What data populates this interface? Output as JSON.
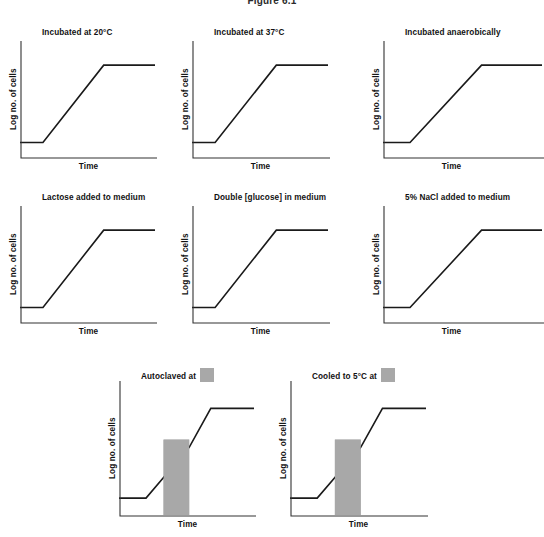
{
  "figure": {
    "caption": "Figure 6.1",
    "axis_color": "#333333",
    "curve_color": "#1a1a1a",
    "band_color": "#a8a8a8",
    "background": "#ffffff"
  },
  "common": {
    "ylabel": "Log no. of cells",
    "xlabel": "Time",
    "swatch_icon": "gray-band-swatch"
  },
  "panels": [
    {
      "id": "incubated-20c",
      "title": "Incubated at 20°C",
      "row": 1,
      "col": 1,
      "show_ylabel": true,
      "band": null
    },
    {
      "id": "incubated-37c",
      "title": "Incubated at 37°C",
      "row": 1,
      "col": 2,
      "show_ylabel": true,
      "band": null
    },
    {
      "id": "incubated-anaerobically",
      "title": "Incubated anaerobically",
      "row": 1,
      "col": 3,
      "show_ylabel": true,
      "band": null
    },
    {
      "id": "lactose-added",
      "title": "Lactose added to medium",
      "row": 2,
      "col": 1,
      "show_ylabel": true,
      "band": null
    },
    {
      "id": "double-glucose",
      "title": "Double [glucose] in medium",
      "row": 2,
      "col": 2,
      "show_ylabel": true,
      "band": null
    },
    {
      "id": "nacl-added",
      "title": "5% NaCl added to medium",
      "row": 2,
      "col": 3,
      "show_ylabel": true,
      "band": null
    },
    {
      "id": "autoclaved-at",
      "title": "Autoclaved at",
      "title_has_swatch": true,
      "row": 3,
      "col": 1,
      "show_ylabel": true,
      "band": {
        "x0": 0.33,
        "x1": 0.52,
        "y_top": 0.58
      }
    },
    {
      "id": "cooled-5c-at",
      "title": "Cooled to 5°C at",
      "title_has_swatch": true,
      "row": 3,
      "col": 2,
      "show_ylabel": true,
      "band": {
        "x0": 0.33,
        "x1": 0.52,
        "y_top": 0.58
      }
    }
  ],
  "chart_data": {
    "type": "line",
    "title": "Figure 6.1",
    "xlabel": "Time",
    "ylabel": "Log no. of cells",
    "xlim": [
      0,
      1
    ],
    "ylim": [
      0,
      1
    ],
    "grid": false,
    "legend": "none",
    "axis_ticks": "none",
    "series": [
      {
        "name": "Incubated at 20°C",
        "panel": "incubated-20c",
        "points": [
          [
            0.0,
            0.13
          ],
          [
            0.17,
            0.13
          ],
          [
            0.62,
            0.82
          ],
          [
            1.0,
            0.82
          ]
        ],
        "phases": [
          "lag",
          "exponential",
          "stationary"
        ]
      },
      {
        "name": "Incubated at 37°C",
        "panel": "incubated-37c",
        "points": [
          [
            0.0,
            0.13
          ],
          [
            0.17,
            0.13
          ],
          [
            0.62,
            0.82
          ],
          [
            1.0,
            0.82
          ]
        ],
        "phases": [
          "lag",
          "exponential",
          "stationary"
        ]
      },
      {
        "name": "Incubated anaerobically",
        "panel": "incubated-anaerobically",
        "points": [
          [
            0.0,
            0.13
          ],
          [
            0.17,
            0.13
          ],
          [
            0.62,
            0.82
          ],
          [
            1.0,
            0.82
          ]
        ],
        "phases": [
          "lag",
          "exponential",
          "stationary"
        ]
      },
      {
        "name": "Lactose added to medium",
        "panel": "lactose-added",
        "points": [
          [
            0.0,
            0.13
          ],
          [
            0.17,
            0.13
          ],
          [
            0.62,
            0.82
          ],
          [
            1.0,
            0.82
          ]
        ],
        "phases": [
          "lag",
          "exponential",
          "stationary"
        ]
      },
      {
        "name": "Double [glucose] in medium",
        "panel": "double-glucose",
        "points": [
          [
            0.0,
            0.13
          ],
          [
            0.17,
            0.13
          ],
          [
            0.62,
            0.82
          ],
          [
            1.0,
            0.82
          ]
        ],
        "phases": [
          "lag",
          "exponential",
          "stationary"
        ]
      },
      {
        "name": "5% NaCl added to medium",
        "panel": "nacl-added",
        "points": [
          [
            0.0,
            0.13
          ],
          [
            0.17,
            0.13
          ],
          [
            0.62,
            0.82
          ],
          [
            1.0,
            0.82
          ]
        ],
        "phases": [
          "lag",
          "exponential",
          "stationary"
        ]
      },
      {
        "name": "Autoclaved at",
        "panel": "autoclaved-at",
        "points": [
          [
            0.0,
            0.13
          ],
          [
            0.2,
            0.13
          ],
          [
            0.52,
            0.52
          ],
          [
            0.68,
            0.82
          ],
          [
            1.0,
            0.82
          ]
        ],
        "phases": [
          "lag",
          "exponential",
          "treatment-band",
          "exponential",
          "stationary"
        ],
        "band": {
          "x0": 0.33,
          "x1": 0.52,
          "y_top": 0.58
        }
      },
      {
        "name": "Cooled to 5°C at",
        "panel": "cooled-5c-at",
        "points": [
          [
            0.0,
            0.13
          ],
          [
            0.2,
            0.13
          ],
          [
            0.52,
            0.52
          ],
          [
            0.68,
            0.82
          ],
          [
            1.0,
            0.82
          ]
        ],
        "phases": [
          "lag",
          "exponential",
          "treatment-band",
          "exponential",
          "stationary"
        ],
        "band": {
          "x0": 0.33,
          "x1": 0.52,
          "y_top": 0.58
        }
      }
    ]
  }
}
